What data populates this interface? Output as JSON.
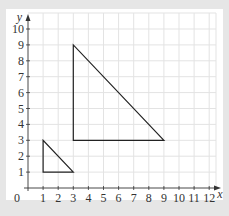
{
  "diagram": {
    "type": "coordinate-grid",
    "axes": {
      "x_label": "x",
      "y_label": "y",
      "origin_label": "0",
      "x_ticks": [
        "1",
        "2",
        "3",
        "4",
        "5",
        "6",
        "7",
        "8",
        "9",
        "10",
        "11",
        "12"
      ],
      "y_ticks": [
        "1",
        "2",
        "3",
        "4",
        "5",
        "6",
        "7",
        "8",
        "9",
        "10"
      ],
      "x_range": [
        0,
        12
      ],
      "y_range": [
        0,
        10
      ]
    },
    "shapes": [
      {
        "name": "small-triangle",
        "vertices": [
          [
            1,
            1
          ],
          [
            1,
            3
          ],
          [
            3,
            1
          ]
        ]
      },
      {
        "name": "large-triangle",
        "vertices": [
          [
            3,
            3
          ],
          [
            3,
            9
          ],
          [
            9,
            3
          ]
        ]
      }
    ],
    "colors": {
      "background": "#e6e6e6",
      "panel": "#ffffff",
      "grid": "#e3e3e3",
      "axis": "#333333",
      "shape": "#222222"
    }
  }
}
